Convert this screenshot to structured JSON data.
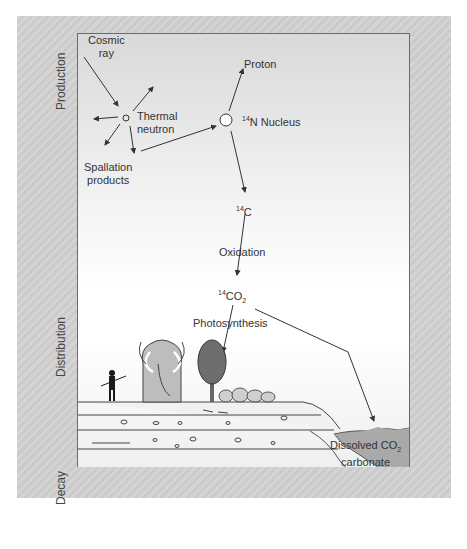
{
  "sections": {
    "production": "Production",
    "distribution": "Distribution",
    "decay": "Decay"
  },
  "production": {
    "cosmic_ray": [
      "Cosmic",
      "ray"
    ],
    "thermal_neutron": [
      "Thermal",
      "neutron"
    ],
    "spallation_products": [
      "Spallation",
      "products"
    ],
    "proton": "Proton",
    "n14_nucleus": {
      "mass": "14",
      "label": "N Nucleus"
    }
  },
  "distribution": {
    "c14": {
      "mass": "14",
      "label": "C"
    },
    "oxidation": "Oxidation",
    "co2": {
      "mass": "14",
      "label": "CO",
      "sub": "2"
    },
    "photosynthesis": "Photosynthesis",
    "dissolved": {
      "line1": "Dissolved CO",
      "sub": "2",
      "line2": "carbonate",
      "line3": "bicarbonate"
    }
  },
  "decay": {
    "particle": "β",
    "particle_sup": "-",
    "from": {
      "mass": "14",
      "label": "C"
    },
    "to": {
      "mass": "14",
      "label": "N"
    },
    "half_life": {
      "symbol": "t",
      "sub": "1/2",
      "text": " = ca. 5700 years"
    }
  },
  "colors": {
    "frame_bg": "#d0d0d0",
    "line": "#333333",
    "water": "#a9a9a9",
    "mammoth": "#bdbdbd",
    "tree": "#6e6e6e",
    "human": "#1a1a1a"
  }
}
